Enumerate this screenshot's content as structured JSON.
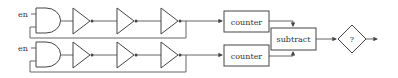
{
  "diagram": {
    "rows": [
      {
        "enable_label": "en",
        "counter_label": "counter"
      },
      {
        "enable_label": "en",
        "counter_label": "counter"
      }
    ],
    "subtract_label": "subtract",
    "decision_label": "?",
    "colors": {
      "stroke": "#444444",
      "background": "#ffffff"
    }
  }
}
